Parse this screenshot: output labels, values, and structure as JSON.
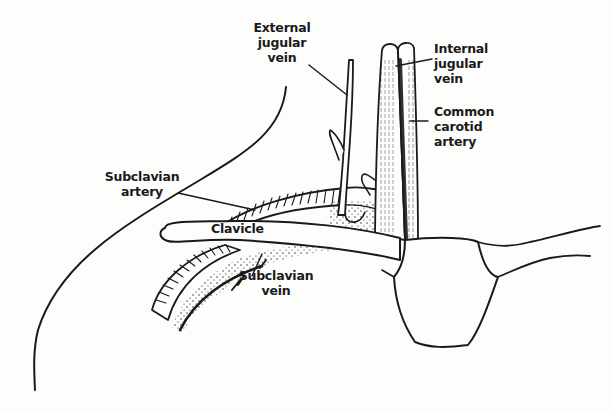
{
  "diagram": {
    "type": "anatomical-illustration",
    "colors": {
      "ink": "#1a1a1a",
      "background": "#fdfdfc"
    },
    "labels": {
      "external_jugular_vein": [
        "External",
        "jugular",
        "vein"
      ],
      "internal_jugular_vein": [
        "Internal",
        "jugular",
        "vein"
      ],
      "common_carotid_artery": [
        "Common",
        "carotid",
        "artery"
      ],
      "subclavian_artery": [
        "Subclavian",
        "artery"
      ],
      "clavicle": [
        "Clavicle"
      ],
      "subclavian_vein": [
        "Subclavian",
        "vein"
      ]
    }
  }
}
